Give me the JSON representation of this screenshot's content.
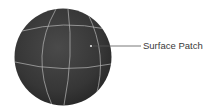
{
  "diagram": {
    "callout": {
      "label": "Surface Patch",
      "marker": "point-on-sphere"
    },
    "colors": {
      "sphere_fill": "#3b3b3b",
      "grid_lines": "#b8b8b8",
      "leader_line": "#555555",
      "label_text": "#3a3a3a",
      "background": "#ffffff"
    }
  }
}
